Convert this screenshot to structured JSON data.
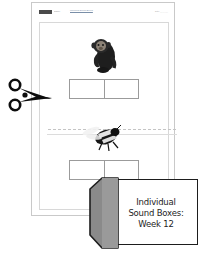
{
  "page": {
    "header": {
      "logo_icon": "publisher-logo-block",
      "subtitle": "Name _______________________",
      "title": "Individual Sound Boxes",
      "instructions": "Say each picture name. Mark a box for each sound you hear.",
      "date_field": "Date _______"
    },
    "sections": [
      {
        "picture_name": "monkey-photo",
        "picture_alt": "monkey",
        "sound_boxes": [
          "",
          ""
        ]
      },
      {
        "picture_name": "bee-photo",
        "picture_alt": "bee",
        "sound_boxes": [
          "",
          ""
        ]
      }
    ],
    "cut_line": {
      "icon": "scissors-icon",
      "hint": ""
    }
  },
  "label_banner": {
    "icon": "folder-tab-icon",
    "lines": [
      "Individual",
      "Sound Boxes:",
      "Week 12"
    ]
  },
  "colors": {
    "page_border": "#c9c9c9",
    "frame_border": "#d8d8d8",
    "box_border": "#9b9b9b",
    "banner_outline": "#1d1d1d",
    "banner_flap": "#8a8a8a",
    "cut_line": "#c4c4c4"
  }
}
